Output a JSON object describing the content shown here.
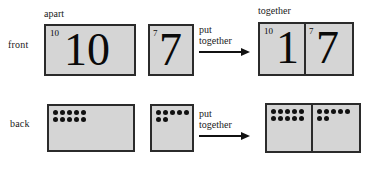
{
  "diagram": {
    "row_labels": {
      "front": "front",
      "back": "back"
    },
    "captions": {
      "apart": "apart",
      "together": "together"
    },
    "arrow_label": {
      "line1": "put",
      "line2": "together"
    },
    "colors": {
      "card_fill": "#d5d5d5",
      "card_border": "#2b2b2b",
      "dot": "#111111",
      "text": "#1a1a1a",
      "background": "#ffffff"
    },
    "front_row": {
      "card_ten": {
        "superscript": "10",
        "numeral": "10"
      },
      "card_seven": {
        "superscript": "7",
        "numeral": "7"
      },
      "card_result": {
        "left_panel": {
          "superscript": "10",
          "numeral": "1"
        },
        "right_panel": {
          "superscript": "7",
          "numeral": "7"
        }
      }
    },
    "back_row": {
      "card_ten": {
        "dot_rows": [
          5,
          5
        ],
        "dot_total": 10
      },
      "card_seven": {
        "dot_rows": [
          5,
          2
        ],
        "dot_total": 7
      },
      "card_result": {
        "left_panel": {
          "dot_rows": [
            5,
            5
          ],
          "dot_total": 10
        },
        "right_panel": {
          "dot_rows": [
            5,
            2
          ],
          "dot_total": 7
        }
      }
    }
  }
}
